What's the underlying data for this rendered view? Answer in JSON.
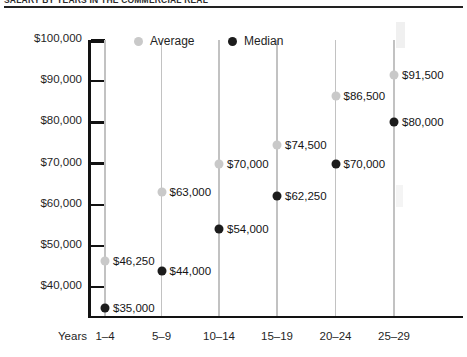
{
  "title": "Salary by Years in the Commercial Real",
  "chart_data": {
    "type": "scatter",
    "title": "Salary by Years in the Commercial Real",
    "xlabel": "Years",
    "ylabel": "",
    "categories": [
      "1–4",
      "5–9",
      "10–14",
      "15–19",
      "20–24",
      "25–29"
    ],
    "ylim": [
      33000,
      100000
    ],
    "yticks": [
      40000,
      50000,
      60000,
      70000,
      80000,
      90000,
      100000
    ],
    "ytick_labels": [
      "$40,000",
      "$50,000",
      "$60,000",
      "$70,000",
      "$80,000",
      "$90,000",
      "$100,000"
    ],
    "grid": "vertical",
    "legend_position": "top-center",
    "series": [
      {
        "name": "Average",
        "color": "#c9c9c9",
        "values": [
          46250,
          63000,
          70000,
          74500,
          86500,
          91500
        ],
        "labels": [
          "$46,250",
          "$63,000",
          "$70,000",
          "$74,500",
          "$86,500",
          "$91,500"
        ]
      },
      {
        "name": "Median",
        "color": "#1c1c1c",
        "values": [
          35000,
          44000,
          54000,
          62250,
          70000,
          80000
        ],
        "labels": [
          "$35,000",
          "$44,000",
          "$54,000",
          "$62,250",
          "$70,000",
          "$80,000"
        ]
      }
    ]
  },
  "axis": {
    "years_caption": "Years"
  },
  "legend": {
    "average_label": "Average",
    "median_label": "Median"
  }
}
